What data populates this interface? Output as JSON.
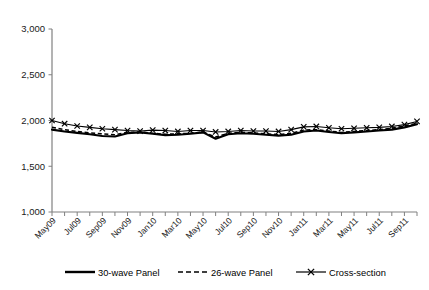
{
  "chart_data": {
    "type": "line",
    "title": "",
    "xlabel": "",
    "ylabel": "",
    "ylim": [
      1000,
      3000
    ],
    "yticks": [
      1000,
      1500,
      2000,
      2500,
      3000
    ],
    "ytick_labels": [
      "1,000",
      "1,500",
      "2,000",
      "2,500",
      "3,000"
    ],
    "grid": false,
    "legend_position": "bottom",
    "x": [
      "May09",
      "Jun09",
      "Jul09",
      "Aug09",
      "Sep09",
      "Oct09",
      "Nov09",
      "Dec09",
      "Jan10",
      "Feb10",
      "Mar10",
      "Apr10",
      "May10",
      "Jun10",
      "Jul10",
      "Aug10",
      "Sep10",
      "Oct10",
      "Nov10",
      "Dec10",
      "Jan11",
      "Feb11",
      "Mar11",
      "Apr11",
      "May11",
      "Jun11",
      "Jul11",
      "Aug11",
      "Sep11",
      "Oct11"
    ],
    "xtick_labels": [
      "May09",
      "Jul09",
      "Sep09",
      "Nov09",
      "Jan10",
      "Mar10",
      "May10",
      "Jul10",
      "Sep10",
      "Nov10",
      "Jan11",
      "Mar11",
      "May11",
      "Jul11",
      "Sep11"
    ],
    "xtick_label_rotation": -45,
    "series": [
      {
        "name": "30-wave Panel",
        "style": "solid",
        "marker": "none",
        "color": "#000000",
        "values": [
          1900,
          1880,
          1865,
          1850,
          1830,
          1825,
          1860,
          1870,
          1855,
          1840,
          1845,
          1855,
          1870,
          1800,
          1850,
          1860,
          1855,
          1845,
          1835,
          1845,
          1880,
          1890,
          1875,
          1860,
          1870,
          1880,
          1890,
          1900,
          1925,
          1960
        ]
      },
      {
        "name": "26-wave Panel",
        "style": "dashed",
        "marker": "none",
        "color": "#000000",
        "values": [
          1925,
          1900,
          1880,
          1865,
          1855,
          1845,
          1870,
          1875,
          1860,
          1850,
          1855,
          1860,
          1875,
          1820,
          1860,
          1870,
          1865,
          1855,
          1845,
          1860,
          1895,
          1900,
          1885,
          1870,
          1880,
          1890,
          1900,
          1915,
          1940,
          1970
        ]
      },
      {
        "name": "Cross-section",
        "style": "solid",
        "marker": "x",
        "color": "#000000",
        "values": [
          2000,
          1965,
          1940,
          1925,
          1910,
          1900,
          1890,
          1885,
          1895,
          1890,
          1880,
          1890,
          1890,
          1875,
          1880,
          1890,
          1885,
          1885,
          1880,
          1900,
          1930,
          1935,
          1920,
          1910,
          1915,
          1920,
          1925,
          1935,
          1955,
          1990
        ]
      }
    ]
  },
  "legend": {
    "items": [
      {
        "label": "30-wave Panel",
        "style": "solid"
      },
      {
        "label": "26-wave Panel",
        "style": "dashed"
      },
      {
        "label": "Cross-section",
        "style": "marker-line"
      }
    ]
  }
}
